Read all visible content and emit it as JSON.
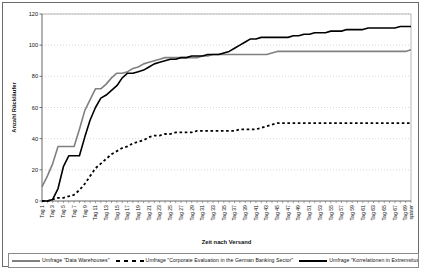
{
  "chart_data": {
    "type": "line",
    "title": "",
    "xlabel": "Zeit nach Versand",
    "ylabel": "Anzahl Rückläufer",
    "ylim": [
      0,
      120
    ],
    "ytick_step": 20,
    "yticks": [
      "0",
      "20",
      "40",
      "60",
      "80",
      "100",
      "120"
    ],
    "grid": "horizontal-dotted",
    "legend_position": "bottom",
    "x": [
      "Tag 1",
      "Tag 2",
      "Tag 3",
      "Tag 4",
      "Tag 5",
      "Tag 6",
      "Tag 7",
      "Tag 8",
      "Tag 9",
      "Tag 10",
      "Tag 11",
      "Tag 12",
      "Tag 13",
      "Tag 14",
      "Tag 15",
      "Tag 16",
      "Tag 17",
      "Tag 18",
      "Tag 19",
      "Tag 20",
      "Tag 21",
      "Tag 22",
      "Tag 23",
      "Tag 24",
      "Tag 25",
      "Tag 26",
      "Tag 27",
      "Tag 28",
      "Tag 29",
      "Tag 30",
      "Tag 31",
      "Tag 32",
      "Tag 33",
      "Tag 34",
      "Tag 35",
      "Tag 36",
      "Tag 37",
      "Tag 38",
      "Tag 39",
      "Tag 40",
      "Tag 41",
      "Tag 42",
      "Tag 43",
      "Tag 44",
      "Tag 45",
      "Tag 46",
      "Tag 47",
      "Tag 48",
      "Tag 49",
      "Tag 50",
      "Tag 51",
      "Tag 52",
      "Tag 53",
      "Tag 54",
      "Tag 55",
      "Tag 56",
      "Tag 57",
      "Tag 58",
      "Tag 59",
      "Tag 60",
      "Tag 61",
      "Tag 62",
      "Tag 63",
      "Tag 64",
      "Tag 65",
      "Tag 66",
      "Tag 67",
      "Tag 68",
      "Tag 69",
      "später"
    ],
    "xticklabels": [
      "Tag 1",
      "Tag 3",
      "Tag 5",
      "Tag 7",
      "Tag 9",
      "Tag 11",
      "Tag 13",
      "Tag 15",
      "Tag 17",
      "Tag 19",
      "Tag 21",
      "Tag 23",
      "Tag 25",
      "Tag 27",
      "Tag 29",
      "Tag 31",
      "Tag 33",
      "Tag 35",
      "Tag 37",
      "Tag 39",
      "Tag 41",
      "Tag 43",
      "Tag 45",
      "Tag 47",
      "Tag 49",
      "Tag 51",
      "Tag 53",
      "Tag 55",
      "Tag 57",
      "Tag 59",
      "Tag 61",
      "Tag 63",
      "Tag 65",
      "Tag 67",
      "Tag 69",
      "später"
    ],
    "series": [
      {
        "name": "Umfrage \"Data Warehouses\"",
        "style": "solid",
        "color": "#808080",
        "values": [
          9,
          16,
          24,
          35,
          35,
          35,
          35,
          46,
          58,
          65,
          72,
          72,
          75,
          79,
          82,
          82,
          83,
          85,
          86,
          88,
          89,
          90,
          91,
          92,
          92,
          92,
          92,
          92,
          92,
          92,
          93,
          93,
          94,
          94,
          94,
          94,
          94,
          94,
          94,
          94,
          94,
          94,
          94,
          95,
          96,
          96,
          96,
          96,
          96,
          96,
          96,
          96,
          96,
          96,
          96,
          96,
          96,
          96,
          96,
          96,
          96,
          96,
          96,
          96,
          96,
          96,
          96,
          96,
          96,
          97
        ]
      },
      {
        "name": "Umfrage \"Corporate Evaluation in the German Banking Sector\"",
        "style": "dotted",
        "color": "#000000",
        "values": [
          0,
          0,
          1,
          2,
          2,
          3,
          4,
          7,
          11,
          16,
          21,
          24,
          27,
          30,
          32,
          34,
          35,
          37,
          38,
          39,
          41,
          42,
          42,
          43,
          43,
          44,
          44,
          44,
          44,
          45,
          45,
          45,
          45,
          45,
          45,
          45,
          45,
          46,
          46,
          46,
          46,
          47,
          48,
          49,
          50,
          50,
          50,
          50,
          50,
          50,
          50,
          50,
          50,
          50,
          50,
          50,
          50,
          50,
          50,
          50,
          50,
          50,
          50,
          50,
          50,
          50,
          50,
          50,
          50,
          50
        ]
      },
      {
        "name": "Umfrage \"Korrelationen in Extremsituationen\"",
        "style": "solid",
        "color": "#000000",
        "values": [
          0,
          0,
          1,
          8,
          22,
          29,
          29,
          29,
          41,
          52,
          60,
          66,
          68,
          71,
          74,
          79,
          82,
          82,
          83,
          84,
          86,
          88,
          89,
          90,
          91,
          91,
          92,
          92,
          93,
          93,
          93,
          94,
          94,
          94,
          95,
          96,
          98,
          100,
          102,
          104,
          104,
          105,
          105,
          105,
          105,
          105,
          105,
          106,
          106,
          107,
          107,
          108,
          108,
          108,
          109,
          109,
          109,
          110,
          110,
          110,
          110,
          111,
          111,
          111,
          111,
          111,
          111,
          112,
          112,
          112
        ]
      }
    ]
  }
}
